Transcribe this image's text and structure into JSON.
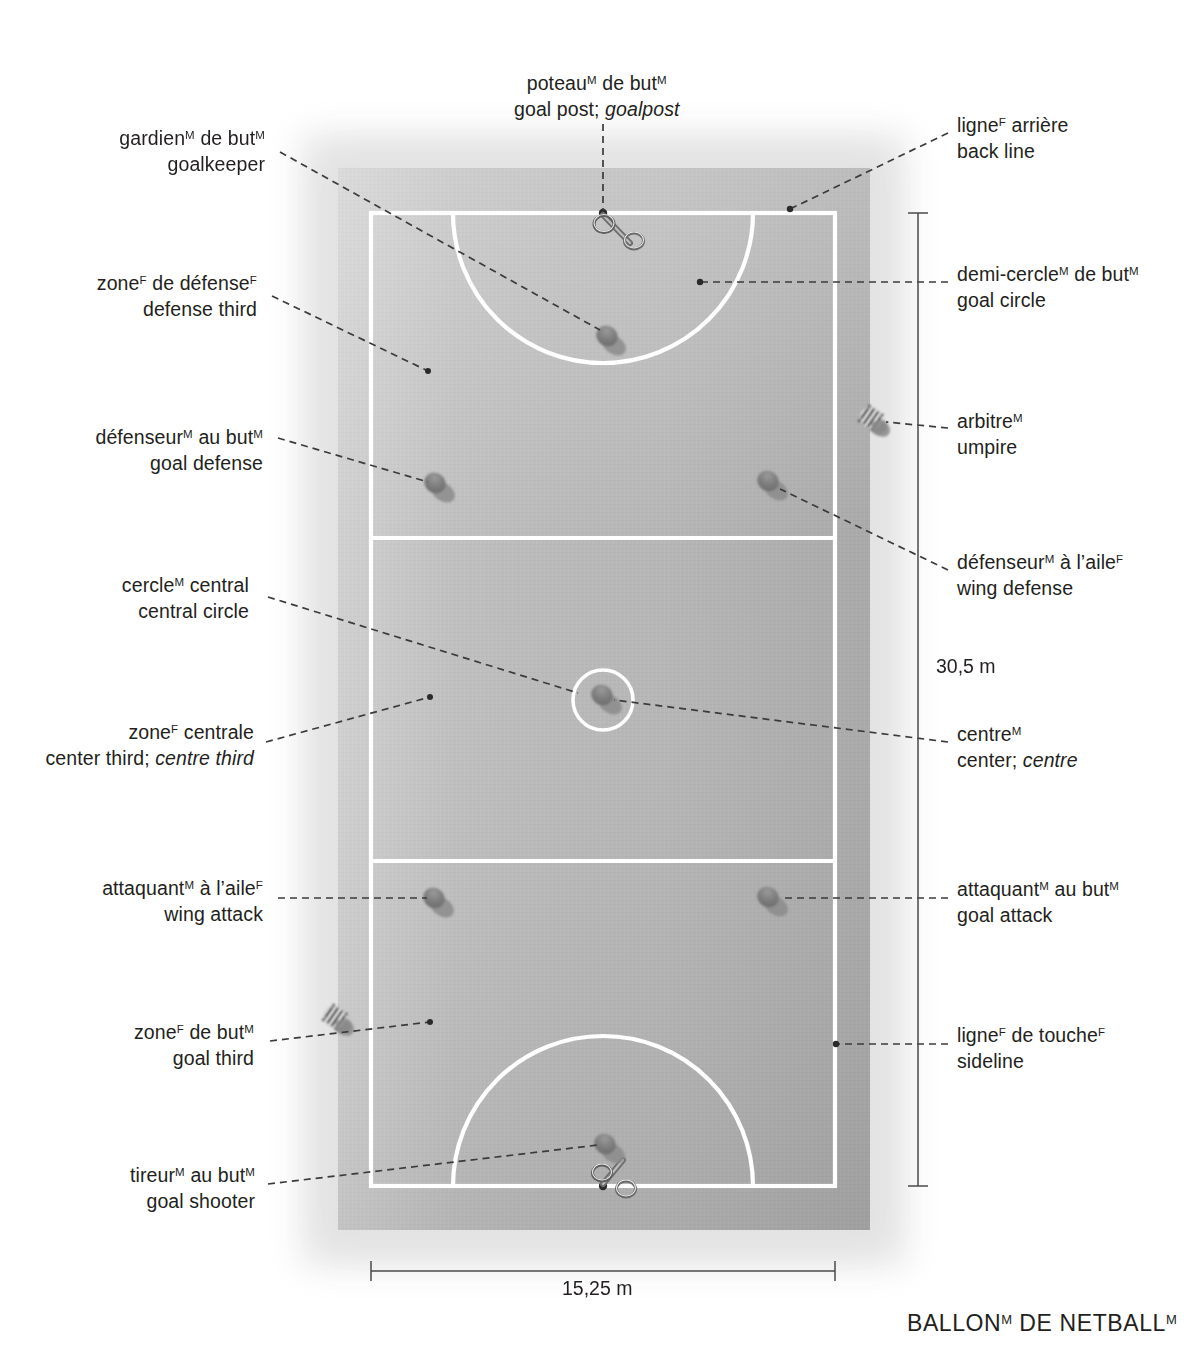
{
  "title": {
    "text": "BALLON DE NETBALL",
    "word1": "BALLON",
    "sup1": "M",
    "word2": " DE NETBALL",
    "sup2": "M"
  },
  "court": {
    "surface_color": "#b9b9b9",
    "line_color": "#ffffff",
    "player_color": "#8a8a8a",
    "leader_color": "#3a3a3a"
  },
  "dimensions": [
    {
      "name": "court-length",
      "value": "30,5 m",
      "orientation": "vertical",
      "side": "right"
    },
    {
      "name": "court-width",
      "value": "15,25 m",
      "orientation": "horizontal",
      "side": "bottom"
    }
  ],
  "labels": [
    {
      "id": "goal-post",
      "side": "top",
      "fr": "poteau",
      "fr_sup": "M",
      "fr_rest": " de but",
      "fr_sup2": "M",
      "en": "goal post; ",
      "en_italic": "goalpost",
      "line1": "poteauᴹ de butᴹ",
      "line2": "goal post; goalpost"
    },
    {
      "id": "goalkeeper",
      "side": "left",
      "fr": "gardien",
      "fr_sup": "M",
      "fr_rest": " de but",
      "fr_sup2": "M",
      "en": "goalkeeper",
      "line1": "gardienᴹ de butᴹ",
      "line2": "goalkeeper"
    },
    {
      "id": "defense-third",
      "side": "left",
      "fr": "zone",
      "fr_sup": "F",
      "fr_rest": " de défense",
      "fr_sup2": "F",
      "en": "defense third",
      "line1": "zoneᶠ de défenseᶠ",
      "line2": "defense third"
    },
    {
      "id": "goal-defense",
      "side": "left",
      "fr": "défenseur",
      "fr_sup": "M",
      "fr_rest": " au but",
      "fr_sup2": "M",
      "en": "goal defense",
      "line1": "défenseurᴹ au butᴹ",
      "line2": "goal defense"
    },
    {
      "id": "central-circle",
      "side": "left",
      "fr": "cercle",
      "fr_sup": "M",
      "fr_rest": " central",
      "fr_sup2": "",
      "en": "central circle",
      "line1": "cercleᴹ central",
      "line2": "central circle"
    },
    {
      "id": "center-third",
      "side": "left",
      "fr": "zone",
      "fr_sup": "F",
      "fr_rest": " centrale",
      "fr_sup2": "",
      "en": "center third; ",
      "en_italic": "centre third",
      "line1": "zoneᶠ centrale",
      "line2": "center third; centre third"
    },
    {
      "id": "wing-attack",
      "side": "left",
      "fr": "attaquant",
      "fr_sup": "M",
      "fr_rest": " à l’aile",
      "fr_sup2": "F",
      "en": "wing attack",
      "line1": "attaquantᴹ à l’aileᶠ",
      "line2": "wing attack"
    },
    {
      "id": "goal-third",
      "side": "left",
      "fr": "zone",
      "fr_sup": "F",
      "fr_rest": " de but",
      "fr_sup2": "M",
      "en": "goal third",
      "line1": "zoneᶠ de butᴹ",
      "line2": "goal third"
    },
    {
      "id": "goal-shooter",
      "side": "left",
      "fr": "tireur",
      "fr_sup": "M",
      "fr_rest": " au but",
      "fr_sup2": "M",
      "en": "goal shooter",
      "line1": "tireurᴹ au butᴹ",
      "line2": "goal shooter"
    },
    {
      "id": "back-line",
      "side": "right",
      "fr": "ligne",
      "fr_sup": "F",
      "fr_rest": " arrière",
      "fr_sup2": "",
      "en": "back line",
      "line1": "ligneᶠ arrière",
      "line2": "back line"
    },
    {
      "id": "goal-circle",
      "side": "right",
      "fr": "demi-cercle",
      "fr_sup": "M",
      "fr_rest": " de but",
      "fr_sup2": "M",
      "en": "goal circle",
      "line1": "demi-cercleᴹ de butᴹ",
      "line2": "goal circle"
    },
    {
      "id": "umpire",
      "side": "right",
      "fr": "arbitre",
      "fr_sup": "M",
      "fr_rest": "",
      "fr_sup2": "",
      "en": "umpire",
      "line1": "arbitreᴹ",
      "line2": "umpire"
    },
    {
      "id": "wing-defense",
      "side": "right",
      "fr": "défenseur",
      "fr_sup": "M",
      "fr_rest": " à l’aile",
      "fr_sup2": "F",
      "en": "wing defense",
      "line1": "défenseurᴹ à l’aileᶠ",
      "line2": "wing defense"
    },
    {
      "id": "center",
      "side": "right",
      "fr": "centre",
      "fr_sup": "M",
      "fr_rest": "",
      "fr_sup2": "",
      "en": "center; ",
      "en_italic": "centre",
      "line1": "centreᴹ",
      "line2": "center; centre"
    },
    {
      "id": "goal-attack",
      "side": "right",
      "fr": "attaquant",
      "fr_sup": "M",
      "fr_rest": " au but",
      "fr_sup2": "M",
      "en": "goal attack",
      "line1": "attaquantᴹ au butᴹ",
      "line2": "goal attack"
    },
    {
      "id": "sideline",
      "side": "right",
      "fr": "ligne",
      "fr_sup": "F",
      "fr_rest": " de touche",
      "fr_sup2": "F",
      "en": "sideline",
      "line1": "ligneᶠ de toucheᶠ",
      "line2": "sideline"
    }
  ],
  "players": [
    {
      "id": "goalkeeper",
      "x": 610,
      "y": 338
    },
    {
      "id": "goal-defense",
      "x": 437,
      "y": 485
    },
    {
      "id": "wing-defense",
      "x": 770,
      "y": 483
    },
    {
      "id": "center",
      "x": 604,
      "y": 697
    },
    {
      "id": "wing-attack",
      "x": 436,
      "y": 900
    },
    {
      "id": "goal-attack",
      "x": 770,
      "y": 899
    },
    {
      "id": "goal-shooter",
      "x": 607,
      "y": 1146
    },
    {
      "id": "umpire-right",
      "x": 873,
      "y": 420,
      "striped": true
    },
    {
      "id": "umpire-left",
      "x": 336,
      "y": 1019,
      "striped": true
    }
  ]
}
